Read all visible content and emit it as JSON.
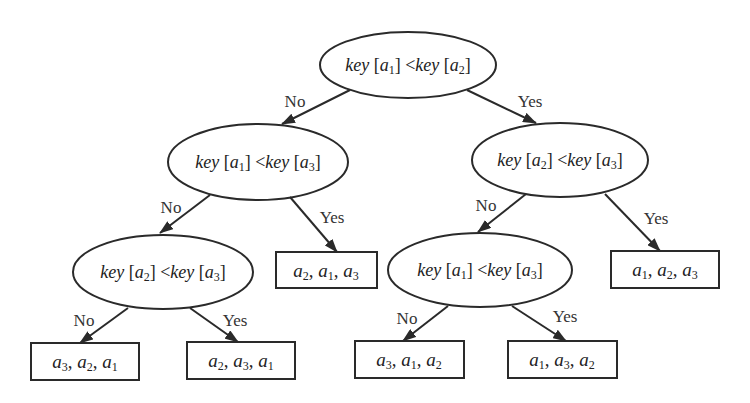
{
  "diagram": {
    "type": "decision-tree",
    "colors": {
      "stroke": "#2a2a2a",
      "text": "#222222",
      "background": "#ffffff"
    },
    "nodes": {
      "n_root": {
        "kind": "condition",
        "left": "a1",
        "right": "a2",
        "left_sub": "1",
        "right_sub": "2",
        "text": "key [a1] < key [a2]"
      },
      "n_l": {
        "kind": "condition",
        "left": "a1",
        "right": "a3",
        "left_sub": "1",
        "right_sub": "3",
        "text": "key [a1] < key [a3]"
      },
      "n_r": {
        "kind": "condition",
        "left": "a2",
        "right": "a3",
        "left_sub": "2",
        "right_sub": "3",
        "text": "key [a2] < key [a3]"
      },
      "n_ll": {
        "kind": "condition",
        "left": "a2",
        "right": "a3",
        "left_sub": "2",
        "right_sub": "3",
        "text": "key [a2] < key [a3]"
      },
      "n_rl": {
        "kind": "condition",
        "left": "a1",
        "right": "a3",
        "left_sub": "1",
        "right_sub": "3",
        "text": "key [a1] < key [a3]"
      },
      "leaf_lll": {
        "kind": "leaf",
        "order": [
          "3",
          "2",
          "1"
        ],
        "text": "a3, a2, a1"
      },
      "leaf_llr": {
        "kind": "leaf",
        "order": [
          "2",
          "3",
          "1"
        ],
        "text": "a2, a3, a1"
      },
      "leaf_lr": {
        "kind": "leaf",
        "order": [
          "2",
          "1",
          "3"
        ],
        "text": "a2, a1, a3"
      },
      "leaf_rll": {
        "kind": "leaf",
        "order": [
          "3",
          "1",
          "2"
        ],
        "text": "a3, a1, a2"
      },
      "leaf_rlr": {
        "kind": "leaf",
        "order": [
          "1",
          "3",
          "2"
        ],
        "text": "a1, a3, a2"
      },
      "leaf_rr": {
        "kind": "leaf",
        "order": [
          "1",
          "2",
          "3"
        ],
        "text": "a1, a2, a3"
      }
    },
    "labels": {
      "key": "key",
      "lt": "<",
      "no": "No",
      "yes": "Yes",
      "a": "a",
      "sep": ", "
    },
    "edges": [
      {
        "from": "n_root",
        "to": "n_l",
        "label": "No"
      },
      {
        "from": "n_root",
        "to": "n_r",
        "label": "Yes"
      },
      {
        "from": "n_l",
        "to": "n_ll",
        "label": "No"
      },
      {
        "from": "n_l",
        "to": "leaf_lr",
        "label": "Yes"
      },
      {
        "from": "n_r",
        "to": "n_rl",
        "label": "No"
      },
      {
        "from": "n_r",
        "to": "leaf_rr",
        "label": "Yes"
      },
      {
        "from": "n_ll",
        "to": "leaf_lll",
        "label": "No"
      },
      {
        "from": "n_ll",
        "to": "leaf_llr",
        "label": "Yes"
      },
      {
        "from": "n_rl",
        "to": "leaf_rll",
        "label": "No"
      },
      {
        "from": "n_rl",
        "to": "leaf_rlr",
        "label": "Yes"
      }
    ]
  }
}
